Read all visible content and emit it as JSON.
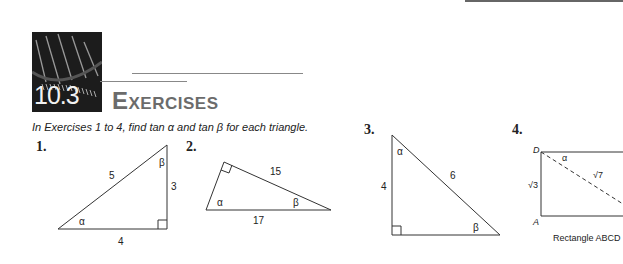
{
  "header": {
    "section_number": "10.3",
    "title": "Exercises"
  },
  "instructions": "In Exercises 1 to 4, find tan α and tan β for each triangle.",
  "exercises": [
    {
      "number": "1.",
      "labels": {
        "hypotenuse": "5",
        "vertical": "3",
        "base": "4",
        "alpha": "α",
        "beta": "β"
      }
    },
    {
      "number": "2.",
      "labels": {
        "leg": "15",
        "hypotenuse": "17",
        "alpha": "α",
        "beta": "β"
      }
    },
    {
      "number": "3.",
      "labels": {
        "vertical": "4",
        "hypotenuse": "6",
        "alpha": "α",
        "beta": "β"
      }
    },
    {
      "number": "4.",
      "labels": {
        "vertex_d": "D",
        "vertex_a": "A",
        "side": "√3",
        "diagonal": "√7",
        "alpha": "α"
      },
      "caption": "Rectangle ABCD"
    }
  ],
  "colors": {
    "title": "#6b6b6b",
    "lines": "#444444"
  }
}
